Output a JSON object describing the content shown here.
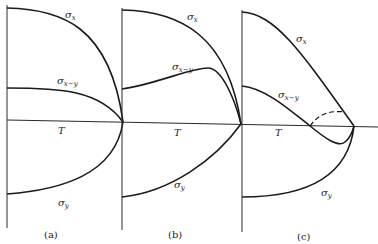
{
  "figure": {
    "axis_label": "T",
    "panels": [
      {
        "caption": "(a)",
        "labels": {
          "sigma_x": "x",
          "sigma_x_y": "x−y",
          "sigma_y": "y"
        }
      },
      {
        "caption": "(b)",
        "labels": {
          "sigma_x": "x",
          "sigma_x_y": "x−y",
          "sigma_y": "y"
        }
      },
      {
        "caption": "(c)",
        "labels": {
          "sigma_x": "x",
          "sigma_x_y": "x−y",
          "sigma_y": "y"
        }
      }
    ],
    "sigma": "σ"
  }
}
